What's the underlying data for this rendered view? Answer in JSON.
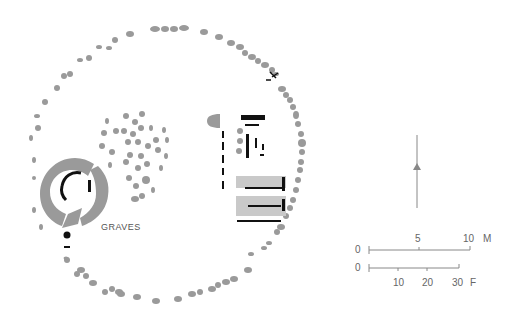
{
  "diagram": {
    "type": "archaeological site plan",
    "colors": {
      "stone": "#9a9a9a",
      "feature": "#111111",
      "scale": "#888888",
      "text": "#555555"
    },
    "labels": {
      "graves": "GRAVES"
    },
    "north_arrow": {
      "icon": "north-arrow-icon"
    },
    "scale_metric": {
      "zero": "0",
      "mid": "5",
      "end": "10",
      "unit": "M"
    },
    "scale_feet": {
      "zero": "0",
      "t1": "10",
      "t2": "20",
      "t3": "30",
      "unit": "F"
    }
  }
}
